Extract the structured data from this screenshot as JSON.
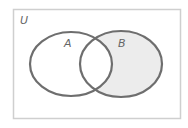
{
  "diagram": {
    "type": "venn",
    "universe_label": "U",
    "sets": [
      {
        "label": "A"
      },
      {
        "label": "B"
      }
    ],
    "shaded_region": "B \\ A",
    "colors": {
      "outline": "#6e6e6e",
      "universe_border": "#cfcfcf",
      "shade": "#ececec",
      "background": "#ffffff",
      "label": "#666666"
    }
  }
}
